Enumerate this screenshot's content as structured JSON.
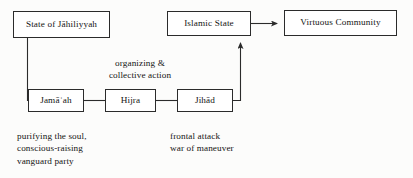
{
  "figure": {
    "type": "flow-diagram",
    "background_color": "#fcfcfb",
    "line_color": "#2b2b2b",
    "text_color": "#141414"
  },
  "nodes": {
    "state_of_jahiliyyah": "State of Jāhiliyyah",
    "islamic_state": "Islamic State",
    "virtuous_community": "Virtuous Community",
    "jamaah": "Jamāʿah",
    "hijra": "Hijra",
    "jihad": "Jihād"
  },
  "edge_labels": {
    "organizing_collective_action": "organizing &\ncollective action"
  },
  "captions": {
    "left": "purifying the soul,\nconscious-raising\nvanguard party",
    "right": "frontal attack\nwar of maneuver"
  },
  "edges": [
    {
      "from": "state_of_jahiliyyah",
      "to": "jamaah",
      "arrow": false
    },
    {
      "from": "jamaah",
      "to": "hijra",
      "arrow": false
    },
    {
      "from": "hijra",
      "to": "jihad",
      "arrow": false
    },
    {
      "from": "jihad",
      "to": "islamic_state",
      "arrow": true
    },
    {
      "from": "islamic_state",
      "to": "virtuous_community",
      "arrow": true
    }
  ]
}
